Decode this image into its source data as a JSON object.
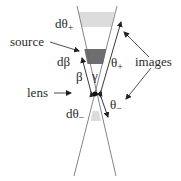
{
  "diagram": {
    "labels": {
      "dtheta_plus": "dθ",
      "dtheta_plus_sub": "+",
      "source": "source",
      "dbeta": "dβ",
      "beta": "β",
      "gamma": "γ",
      "theta_plus": "θ",
      "theta_plus_sub": "+",
      "images": "images",
      "lens": "lens",
      "theta_minus": "θ",
      "theta_minus_sub": "−",
      "dtheta_minus": "dθ",
      "dtheta_minus_sub": "−"
    },
    "colors": {
      "line": "#555555",
      "source_band": "#6e6e6e",
      "image_band": "#dcdcdc",
      "lens_dot": "#111111",
      "text": "#2a2a2a"
    },
    "nodes": [
      {
        "id": "lens",
        "label": "lens"
      },
      {
        "id": "source",
        "label": "source"
      },
      {
        "id": "image_plus",
        "label": "images"
      },
      {
        "id": "image_minus",
        "label": "images"
      }
    ],
    "edges": [
      {
        "from": "lens",
        "to": "source",
        "label": "β"
      },
      {
        "from": "lens",
        "to": "image_plus",
        "label": "θ+"
      },
      {
        "from": "lens",
        "to": "image_minus",
        "label": "θ−"
      }
    ]
  }
}
